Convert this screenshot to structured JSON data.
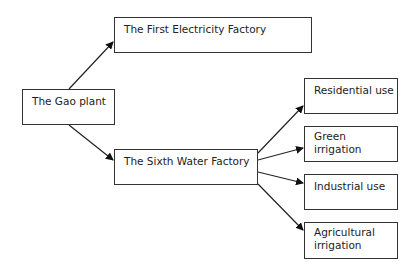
{
  "diagram": {
    "nodes": {
      "gao_plant": "The Gao plant",
      "first_electricity": "The First Electricity Factory",
      "sixth_water": "The Sixth Water Factory",
      "residential": "Residential use",
      "green_line1": "Green",
      "green_line2": "irrigation",
      "industrial": "Industrial use",
      "agri_line1": "Agricultural",
      "agri_line2": "irrigation"
    },
    "edges": [
      {
        "from": "The Gao plant",
        "to": "The First Electricity Factory"
      },
      {
        "from": "The Gao plant",
        "to": "The Sixth Water Factory"
      },
      {
        "from": "The Sixth Water Factory",
        "to": "Residential use"
      },
      {
        "from": "The Sixth Water Factory",
        "to": "Green irrigation"
      },
      {
        "from": "The Sixth Water Factory",
        "to": "Industrial use"
      },
      {
        "from": "The Sixth Water Factory",
        "to": "Agricultural irrigation"
      }
    ]
  }
}
